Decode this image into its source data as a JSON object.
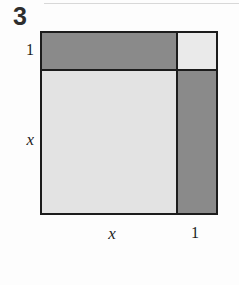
{
  "figure": {
    "problem_number": "3",
    "type": "area-model-square",
    "side_labels": {
      "left_top_segment": "1",
      "left_bottom_segment": "x",
      "bottom_left_segment": "x",
      "bottom_right_segment": "1"
    },
    "regions": [
      {
        "id": "x-times-1-top",
        "name": "top-left-rectangle",
        "dimensions": "x by 1",
        "shade": "dark",
        "color": "#8a8a8a"
      },
      {
        "id": "1-times-1",
        "name": "top-right-square",
        "dimensions": "1 by 1",
        "shade": "light",
        "color": "#eaeaea"
      },
      {
        "id": "x-squared",
        "name": "bottom-left-square",
        "dimensions": "x by x",
        "shade": "light",
        "color": "#e3e3e3"
      },
      {
        "id": "x-times-1-right",
        "name": "bottom-right-rectangle",
        "dimensions": "1 by x",
        "shade": "dark",
        "color": "#8a8a8a"
      }
    ],
    "colors": {
      "outline": "#1c1c1c",
      "dark_fill": "#8a8a8a",
      "light_fill": "#e3e3e3",
      "lightest_fill": "#eaeaea",
      "background": "#fdfdfd",
      "text": "#1d1d1d"
    }
  }
}
